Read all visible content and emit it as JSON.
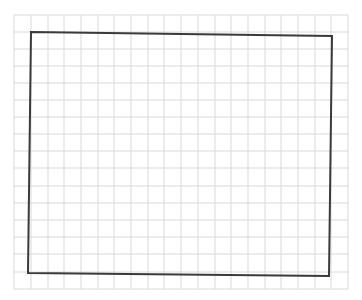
{
  "canvas": {
    "width": 362,
    "height": 300,
    "background": "#ffffff"
  },
  "grid": {
    "x_lines": [
      14,
      31,
      48,
      64,
      81,
      98,
      114,
      131,
      148,
      164,
      181,
      198,
      215,
      231,
      248,
      265,
      281,
      298,
      315,
      331,
      348
    ],
    "y_lines": [
      15,
      32,
      49,
      66,
      83,
      100,
      117,
      134,
      151,
      168,
      186,
      203,
      220,
      237,
      254,
      272,
      289
    ],
    "left": 14,
    "right": 348,
    "top": 15,
    "bottom": 289,
    "color": "#d9d9d9"
  },
  "rectangle": {
    "points": [
      [
        31,
        32
      ],
      [
        332,
        36
      ],
      [
        329,
        276
      ],
      [
        28,
        273
      ]
    ],
    "stroke": "#3a3a3a",
    "stroke_width": 2
  }
}
